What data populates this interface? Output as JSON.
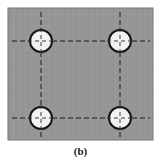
{
  "figure": {
    "caption": "(b)",
    "canvas": {
      "width": 161,
      "height": 164,
      "background": "#ffffff"
    },
    "plate": {
      "label": "plate",
      "shape": "rectangle",
      "x": 8,
      "y": 8,
      "width": 145,
      "height": 132,
      "fill": "#969696",
      "stroke": "#6e6e6e",
      "stroke_width": 1
    },
    "holes": [
      {
        "label": "hole-top-left",
        "cx": 41,
        "cy": 41,
        "r": 11,
        "fill": "#f2f2f2",
        "stroke": "#151515",
        "stroke_width": 2
      },
      {
        "label": "hole-top-right",
        "cx": 120,
        "cy": 41,
        "r": 11,
        "fill": "#f2f2f2",
        "stroke": "#151515",
        "stroke_width": 2
      },
      {
        "label": "hole-bottom-left",
        "cx": 41,
        "cy": 118,
        "r": 11,
        "fill": "#f2f2f2",
        "stroke": "#151515",
        "stroke_width": 2
      },
      {
        "label": "hole-bottom-right",
        "cx": 120,
        "cy": 118,
        "r": 11,
        "fill": "#f2f2f2",
        "stroke": "#151515",
        "stroke_width": 2
      }
    ],
    "centerlines": {
      "stroke": "#1b1b1b",
      "stroke_width": 1,
      "dash_pattern": "5,3",
      "horizontal": [
        {
          "label": "centerline-horizontal-top",
          "y": 41,
          "x1": 12,
          "x2": 150
        },
        {
          "label": "centerline-horizontal-bottom",
          "y": 118,
          "x1": 12,
          "x2": 150
        }
      ],
      "vertical": [
        {
          "label": "centerline-vertical-left",
          "x": 41,
          "y1": 12,
          "y2": 137
        },
        {
          "label": "centerline-vertical-right",
          "x": 120,
          "y1": 12,
          "y2": 137
        }
      ]
    },
    "colors": {
      "plate_gray": "#969696",
      "hole_white": "#f2f2f2",
      "line_black": "#151515",
      "background_white": "#ffffff"
    }
  }
}
